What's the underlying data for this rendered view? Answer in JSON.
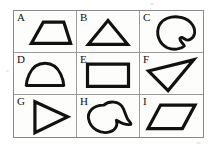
{
  "page": {
    "background_color": "#ffffff",
    "frame_color": "#8a8a8a",
    "stroke_color": "#111111",
    "rows": 3,
    "columns": 3
  },
  "cells": [
    {
      "label": "A",
      "shape_name": "trapezoid",
      "description": "Trapezoid with long horizontal bottom edge, shorter top edge, slanted sides",
      "points": "22,34 46,10 56,10 58,10 62,34",
      "path": "M 16 38 L 30 13 L 54 13 L 62 38 Z"
    },
    {
      "label": "B",
      "shape_name": "triangle-isosceles",
      "description": "Upright isosceles triangle",
      "path": "M 32 11 L 55 39 L 9 39 Z"
    },
    {
      "label": "C",
      "shape_name": "circle-with-notch",
      "description": "Closed rounded blob, circle with a concave notch on the upper right",
      "path": "M 44 7 C 57 8 64 18 63 26 C 62 32 56 36 52 33 C 49 31 47 30 46 32 C 45 35 50 38 51 41 C 47 45 38 46 31 43 C 21 38 17 26 22 16 C 26 9 35 6 44 7 Z"
    },
    {
      "label": "D",
      "shape_name": "semicircle",
      "description": "Half disc with flat horizontal bottom edge and domed top",
      "path": "M 14 38 L 58 38 C 58 38 56 12 36 12 C 16 12 14 38 14 38 Z"
    },
    {
      "label": "E",
      "shape_name": "rectangle",
      "description": "Horizontal rectangle",
      "path": "M 9 13 L 57 13 L 57 39 L 9 39 Z"
    },
    {
      "label": "F",
      "shape_name": "triangle-scalene",
      "description": "Thin scalene triangle with apex pointing to the upper right",
      "path": "M 8 21 L 61 8 L 31 44 Z"
    },
    {
      "label": "G",
      "shape_name": "triangle-right-pointing",
      "description": "Triangle pointing to the right",
      "path": "M 21 8 L 60 26 L 21 45 Z"
    },
    {
      "label": "H",
      "shape_name": "crescent-comma",
      "description": "Comma or paisley shape, convex left lobe with concave sweep to a point at the lower right",
      "path": "M 30 12 C 37 6 48 8 52 14 C 56 20 56 27 60 31 C 62 33 63 34 62 35 C 57 36 50 33 45 30 C 47 36 44 42 37 44 C 26 47 14 40 12 29 C 10 20 17 12 30 12 Z"
    },
    {
      "label": "I",
      "shape_name": "parallelogram",
      "description": "Parallelogram slanting to the right",
      "path": "M 21 12 L 62 12 L 47 40 L 6 40 Z"
    }
  ]
}
